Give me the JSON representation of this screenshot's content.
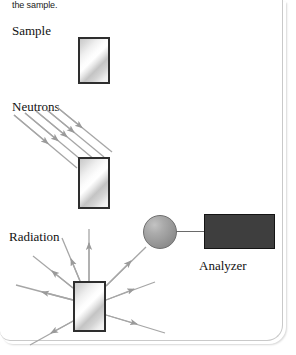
{
  "figure": {
    "caption_top": "the sample.",
    "labels": {
      "sample": "Sample",
      "neutrons": "Neutrons",
      "radiation": "Radiation",
      "analyzer": "Analyzer"
    },
    "colors": {
      "slab_border": "#2e2e2e",
      "slab_fill_light": "#ffffff",
      "slab_fill_dark": "#c4c4c4",
      "detector_fill": "#9a9a9a",
      "analyzer_fill": "#3e3e3e",
      "analyzer_border": "#141414",
      "arrow_stroke": "#9a9a9a",
      "wire": "#6a6a6a",
      "page_background": "#ffffff",
      "card_edge": "#c9c9c9"
    },
    "elements": {
      "slab_top": "sample-slab-top",
      "slab_mid": "sample-slab-irradiated",
      "slab_bottom": "sample-slab-emitting",
      "detector": "detector-sphere",
      "analyzer": "analyzer-box",
      "wire": "detector-analyzer-wire"
    },
    "beams": {
      "neutron_arrow_count": 5,
      "neutron_direction": "down-right",
      "radiation_arrow_count": 9,
      "radiation_direction": "outward-radial"
    }
  }
}
